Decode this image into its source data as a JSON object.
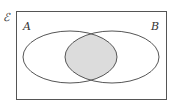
{
  "diagram": {
    "type": "venn",
    "universal_set_symbol": "ℰ",
    "sets": [
      {
        "name": "A",
        "label": "A"
      },
      {
        "name": "B",
        "label": "B"
      }
    ],
    "shaded_region": "A ∩ B",
    "colors": {
      "stroke": "#555555",
      "shade": "#dcdcdc",
      "background": "#ffffff",
      "text": "#333333"
    }
  }
}
